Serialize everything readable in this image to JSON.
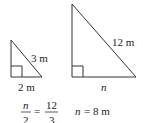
{
  "diagram": {
    "small_triangle": {
      "hypotenuse_label": "3 m",
      "base_label": "2 m"
    },
    "large_triangle": {
      "hypotenuse_label": "12 m",
      "base_label": "n"
    },
    "equation": {
      "left_numerator": "n",
      "left_denominator": "2",
      "equals": "=",
      "right_numerator": "12",
      "right_denominator": "3",
      "result_var": "n",
      "result_rest": "= 8 m"
    },
    "colors": {
      "line": "#333333",
      "text": "#222222",
      "background": "#ffffff"
    }
  }
}
